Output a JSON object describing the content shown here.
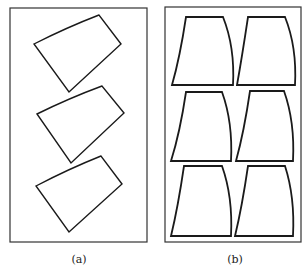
{
  "figure": {
    "stroke_color": "#1a1a1a",
    "frame_color": "#333333",
    "panels": [
      {
        "id": "a",
        "caption": "(a)",
        "frame": {
          "x": 10,
          "y": 8,
          "w": 137,
          "h": 234
        },
        "description": "Three irregular quadrilaterals, rotated, stacked vertically",
        "shapes": [
          {
            "points": "34,44 99,15 121,44 69,92",
            "curved_top": true
          },
          {
            "points": "37,114 102,86 124,113 71,163",
            "curved_top": true
          },
          {
            "points": "36,186 101,156 122,184 69,232",
            "curved_top": true
          }
        ]
      },
      {
        "id": "b",
        "caption": "(b)",
        "frame": {
          "x": 165,
          "y": 7,
          "w": 136,
          "h": 235
        },
        "description": "Six trapezoids with curved sides arranged in a 3x2 grid",
        "shapes": [
          {
            "tl": [
              186,
              17
            ],
            "tr": [
              223,
              17
            ],
            "br": [
              233,
              85
            ],
            "bl": [
              172,
              85
            ]
          },
          {
            "tl": [
              248,
              17
            ],
            "tr": [
              285,
              17
            ],
            "br": [
              295,
              85
            ],
            "bl": [
              237,
              85
            ]
          },
          {
            "tl": [
              186,
              92
            ],
            "tr": [
              222,
              92
            ],
            "br": [
              231,
              161
            ],
            "bl": [
              171,
              161
            ]
          },
          {
            "tl": [
              250,
              91
            ],
            "tr": [
              284,
              91
            ],
            "br": [
              293,
              161
            ],
            "bl": [
              236,
              161
            ]
          },
          {
            "tl": [
              184,
              166
            ],
            "tr": [
              222,
              166
            ],
            "br": [
              231,
              236
            ],
            "bl": [
              171,
              236
            ]
          },
          {
            "tl": [
              248,
              166
            ],
            "tr": [
              285,
              166
            ],
            "br": [
              293,
              236
            ],
            "bl": [
              235,
              236
            ]
          }
        ]
      }
    ]
  }
}
